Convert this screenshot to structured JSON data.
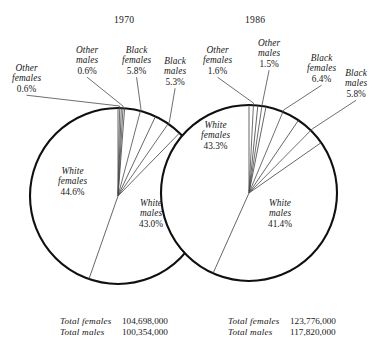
{
  "figure": {
    "title": "",
    "style": "twin pie charts, line engraving"
  },
  "panels": [
    {
      "year": "1970",
      "center": {
        "x": 118,
        "y": 196
      },
      "radius": 88,
      "totals": [
        {
          "label": "Total females",
          "value": "104,698,000"
        },
        {
          "label": "Total males",
          "value": "100,354,000"
        }
      ],
      "slices": [
        {
          "key": "other-females",
          "name": "Other\nfemales",
          "line1": "Other",
          "line2": "females",
          "pct": "0.6%",
          "value": 0.6
        },
        {
          "key": "other-males",
          "name": "Other\nmales",
          "line1": "Other",
          "line2": "males",
          "pct": "0.6%",
          "value": 0.6
        },
        {
          "key": "black-females",
          "name": "Black\nfemales",
          "line1": "Black",
          "line2": "females",
          "pct": "5.8%",
          "value": 5.8
        },
        {
          "key": "black-males",
          "name": "Black\nmales",
          "line1": "Black",
          "line2": "males",
          "pct": "5.3%",
          "value": 5.3
        },
        {
          "key": "white-males",
          "name": "White\nmales",
          "line1": "White",
          "line2": "males",
          "pct": "43.0%",
          "value": 43.0
        },
        {
          "key": "white-females",
          "name": "White\nfemales",
          "line1": "White",
          "line2": "females",
          "pct": "44.6%",
          "value": 44.6
        }
      ]
    },
    {
      "year": "1986",
      "center": {
        "x": 249,
        "y": 193
      },
      "radius": 88,
      "totals": [
        {
          "label": "Total females",
          "value": "123,776,000"
        },
        {
          "label": "Total males",
          "value": "117,820,000"
        }
      ],
      "slices": [
        {
          "key": "other-females",
          "name": "Other\nfemales",
          "line1": "Other",
          "line2": "females",
          "pct": "1.6%",
          "value": 1.6
        },
        {
          "key": "other-males",
          "name": "Other\nmales",
          "line1": "Other",
          "line2": "males",
          "pct": "1.5%",
          "value": 1.5
        },
        {
          "key": "black-females",
          "name": "Black\nfemales",
          "line1": "Black",
          "line2": "females",
          "pct": "6.4%",
          "value": 6.4
        },
        {
          "key": "black-males",
          "name": "Black\nmales",
          "line1": "Black",
          "line2": "males",
          "pct": "5.8%",
          "value": 5.8
        },
        {
          "key": "white-males",
          "name": "White\nmales",
          "line1": "White",
          "line2": "males",
          "pct": "41.4%",
          "value": 41.4
        },
        {
          "key": "white-females",
          "name": "White\nfemales",
          "line1": "White",
          "line2": "females",
          "pct": "43.3%",
          "value": 43.3
        }
      ]
    }
  ],
  "labels": {
    "p0": {
      "year_pos": {
        "x": 114,
        "y": 14
      },
      "outside": [
        {
          "key": "other-females",
          "x": 12,
          "y": 63,
          "align": "center"
        },
        {
          "key": "other-males",
          "x": 76,
          "y": 45,
          "align": "center"
        },
        {
          "key": "black-females",
          "x": 122,
          "y": 45,
          "align": "center"
        },
        {
          "key": "black-males",
          "x": 164,
          "y": 56,
          "align": "center"
        }
      ],
      "inside": [
        {
          "key": "white-females",
          "x": 58,
          "y": 166
        },
        {
          "key": "white-males",
          "x": 139,
          "y": 198
        }
      ],
      "totals_pos": {
        "x": 60,
        "y": 316
      }
    },
    "p1": {
      "year_pos": {
        "x": 245,
        "y": 14
      },
      "outside": [
        {
          "key": "other-females",
          "x": 203,
          "y": 45,
          "align": "center"
        },
        {
          "key": "other-males",
          "x": 258,
          "y": 38,
          "align": "center"
        },
        {
          "key": "black-females",
          "x": 307,
          "y": 53,
          "align": "center"
        },
        {
          "key": "black-males",
          "x": 345,
          "y": 68,
          "align": "center"
        }
      ],
      "inside": [
        {
          "key": "white-females",
          "x": 201,
          "y": 120
        },
        {
          "key": "white-males",
          "x": 268,
          "y": 198
        }
      ],
      "totals_pos": {
        "x": 228,
        "y": 316
      }
    }
  },
  "colors": {
    "ink": "#1a1a1a",
    "rim": "#101010",
    "hairline": "#4a4a4a",
    "background": "#ffffff"
  },
  "chart_data": [
    {
      "type": "pie",
      "title": "1970",
      "categories": [
        "Other females",
        "Other males",
        "Black females",
        "Black males",
        "White males",
        "White females"
      ],
      "values": [
        0.6,
        0.6,
        5.8,
        5.3,
        43.0,
        44.6
      ],
      "unit": "percent",
      "annotations": [
        "Total females 104,698,000",
        "Total males 100,354,000"
      ],
      "legend": "none",
      "grid": false
    },
    {
      "type": "pie",
      "title": "1986",
      "categories": [
        "Other females",
        "Other males",
        "Black females",
        "Black males",
        "White males",
        "White females"
      ],
      "values": [
        1.6,
        1.5,
        6.4,
        5.8,
        41.4,
        43.3
      ],
      "unit": "percent",
      "annotations": [
        "Total females 123,776,000",
        "Total males 117,820,000"
      ],
      "legend": "none",
      "grid": false
    }
  ]
}
